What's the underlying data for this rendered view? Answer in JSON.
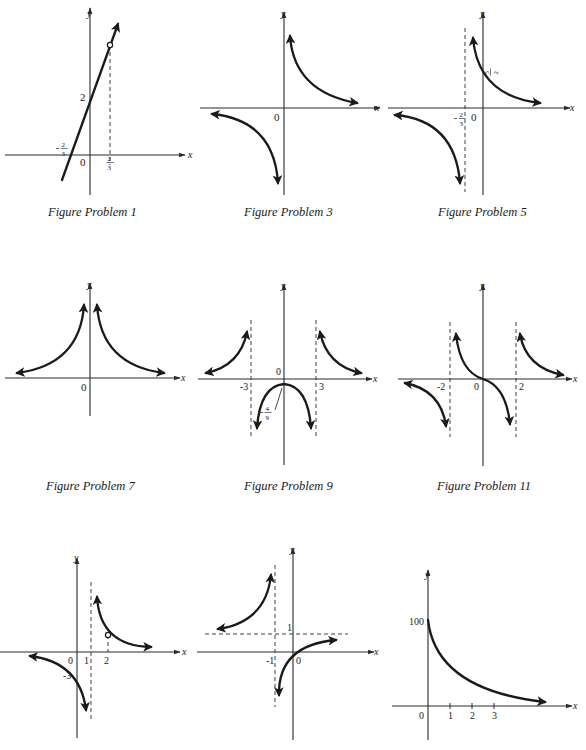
{
  "page": {
    "captions": [
      {
        "id": "fig1",
        "label": "Figure Problem 1",
        "x": 48,
        "y": 205
      },
      {
        "id": "fig3",
        "label": "Figure Problem 3",
        "x": 244,
        "y": 205
      },
      {
        "id": "fig5",
        "label": "Figure Problem 5",
        "x": 438,
        "y": 205
      },
      {
        "id": "fig7",
        "label": "Figure Problem 7",
        "x": 46,
        "y": 479
      },
      {
        "id": "fig9",
        "label": "Figure Problem 9",
        "x": 244,
        "y": 479
      },
      {
        "id": "fig11",
        "label": "Figure Problem 11",
        "x": 437,
        "y": 479
      }
    ]
  },
  "chart_data": [
    {
      "id": "fig1",
      "type": "line",
      "title": "Figure Problem 1",
      "xlabel": "x",
      "ylabel": "y",
      "description": "Line y = 3x + 2 with a hole at x = 2/3",
      "tick_labels": {
        "x": [
          "-2/3",
          "0",
          "2/3"
        ],
        "y": [
          "2"
        ]
      },
      "hole": {
        "x": "2/3",
        "y": 4
      },
      "dashed_lines": [
        {
          "orientation": "vertical",
          "at": "2/3"
        }
      ]
    },
    {
      "id": "fig3",
      "type": "line",
      "title": "Figure Problem 3",
      "xlabel": "x",
      "ylabel": "y",
      "description": "Hyperbola with branches in quadrants I and III, asymptotes x=0 and y=0",
      "tick_labels": {
        "x": [
          "0"
        ],
        "y": []
      }
    },
    {
      "id": "fig5",
      "type": "line",
      "title": "Figure Problem 5",
      "xlabel": "x",
      "ylabel": "y",
      "description": "Hyperbola with vertical asymptote x = -2/3, y-intercept 5/2",
      "tick_labels": {
        "x": [
          "-2/3",
          "0"
        ],
        "y": [
          "5/2"
        ]
      },
      "dashed_lines": [
        {
          "orientation": "vertical",
          "at": "-2/3"
        }
      ]
    },
    {
      "id": "fig7",
      "type": "line",
      "title": "Figure Problem 7",
      "xlabel": "x",
      "ylabel": "y",
      "description": "Even function with vertical asymptote x=0, both branches above x-axis",
      "tick_labels": {
        "x": [
          "0"
        ],
        "y": []
      }
    },
    {
      "id": "fig9",
      "type": "line",
      "title": "Figure Problem 9",
      "xlabel": "x",
      "ylabel": "y",
      "description": "Rational function with vertical asymptotes x = -3 and x = 3, local max at (0, -4/9)",
      "tick_labels": {
        "x": [
          "-3",
          "0",
          "3"
        ],
        "y": [
          "-4/9"
        ]
      },
      "dashed_lines": [
        {
          "orientation": "vertical",
          "at": -3
        },
        {
          "orientation": "vertical",
          "at": 3
        }
      ]
    },
    {
      "id": "fig11",
      "type": "line",
      "title": "Figure Problem 11",
      "xlabel": "x",
      "ylabel": "y",
      "description": "Odd rational function with vertical asymptotes x = -2 and x = 2, passes through origin",
      "tick_labels": {
        "x": [
          "-2",
          "0",
          "2"
        ],
        "y": []
      },
      "dashed_lines": [
        {
          "orientation": "vertical",
          "at": -2
        },
        {
          "orientation": "vertical",
          "at": 2
        }
      ]
    },
    {
      "id": "fig13",
      "type": "line",
      "title": "",
      "xlabel": "x",
      "ylabel": "y",
      "description": "Hyperbola with vertical asymptote x = 1, y-intercept -3, hole at x = 2",
      "tick_labels": {
        "x": [
          "0",
          "1",
          "2"
        ],
        "y": [
          "-3"
        ]
      },
      "hole": {
        "x": 2
      },
      "dashed_lines": [
        {
          "orientation": "vertical",
          "at": 1
        },
        {
          "orientation": "vertical",
          "at": 2
        }
      ]
    },
    {
      "id": "fig15",
      "type": "line",
      "title": "",
      "xlabel": "x",
      "ylabel": "y",
      "description": "Hyperbola with vertical asymptote x = -1, horizontal asymptote y = 1, passes through origin",
      "tick_labels": {
        "x": [
          "-1",
          "0"
        ],
        "y": [
          "1"
        ]
      },
      "dashed_lines": [
        {
          "orientation": "vertical",
          "at": -1
        },
        {
          "orientation": "horizontal",
          "at": 1
        }
      ]
    },
    {
      "id": "fig17",
      "type": "line",
      "title": "",
      "xlabel": "x",
      "ylabel": "y",
      "description": "Decaying curve starting at y = 100 when x = 0, approaching 0",
      "tick_labels": {
        "x": [
          "0",
          "1",
          "2",
          "3"
        ],
        "y": [
          "100"
        ]
      },
      "ylim": [
        0,
        100
      ]
    }
  ],
  "figures": [
    {
      "id": "fig1",
      "axes": {
        "ox": 90,
        "oy": 155,
        "xmin": 5,
        "xmax": 185,
        "ymin": 8,
        "ymax": 195
      },
      "axis_labels": [
        {
          "t": "y",
          "x": 87,
          "y": 17
        },
        {
          "t": "x",
          "x": 188,
          "y": 158
        }
      ],
      "dashed": [
        [
          110,
          45,
          110,
          165
        ]
      ],
      "curves": [
        {
          "d": "M62,180 L118,24",
          "arrow_end": true
        }
      ],
      "holes": [
        [
          110,
          45
        ]
      ],
      "labels": [
        {
          "t": "2",
          "x": 80,
          "y": 101,
          "size": 11
        },
        {
          "t": "0",
          "x": 80,
          "y": 166,
          "size": 11
        }
      ],
      "fractions": [
        {
          "neg": true,
          "n": "2",
          "d": "3",
          "x": 64,
          "y": 148
        },
        {
          "neg": false,
          "n": "2",
          "d": "3",
          "x": 110,
          "y": 162
        }
      ]
    },
    {
      "id": "fig3",
      "axes": {
        "ox": 284,
        "oy": 108,
        "xmin": 200,
        "xmax": 380,
        "ymin": 12,
        "ymax": 195
      },
      "axis_labels": [
        {
          "t": "y",
          "x": 281,
          "y": 17
        },
        {
          "t": "x",
          "x": 375,
          "y": 111
        }
      ],
      "dashed": [],
      "curves": [
        {
          "d": "M290,36 Q294,92 357,103",
          "arrow_start": true,
          "arrow_end": true
        },
        {
          "d": "M212,114 Q274,120 278,183",
          "arrow_start": true,
          "arrow_end": true
        }
      ],
      "holes": [],
      "labels": [
        {
          "t": "0",
          "x": 274,
          "y": 121,
          "size": 11
        }
      ],
      "fractions": []
    },
    {
      "id": "fig5",
      "axes": {
        "ox": 483,
        "oy": 108,
        "xmin": 388,
        "xmax": 570,
        "ymin": 12,
        "ymax": 195
      },
      "axis_labels": [
        {
          "t": "y",
          "x": 480,
          "y": 17
        },
        {
          "t": "x",
          "x": 570,
          "y": 111
        }
      ],
      "dashed": [
        [
          465,
          28,
          465,
          192
        ]
      ],
      "curves": [
        {
          "d": "M473,38 Q478,96 540,103",
          "arrow_start": true,
          "arrow_end": true
        },
        {
          "d": "M395,115 Q455,120 460,183",
          "arrow_start": true,
          "arrow_end": true
        }
      ],
      "holes": [],
      "labels": [
        {
          "t": "0",
          "x": 471,
          "y": 121,
          "size": 11
        }
      ],
      "fractions": [
        {
          "neg": false,
          "n": "5",
          "d": "2",
          "x": 490,
          "y": 72,
          "rotate": true
        },
        {
          "neg": true,
          "n": "2",
          "d": "3",
          "x": 462,
          "y": 118
        }
      ]
    },
    {
      "id": "fig7",
      "axes": {
        "ox": 90,
        "oy": 378,
        "xmin": 5,
        "xmax": 180,
        "ymin": 283,
        "ymax": 416
      },
      "axis_labels": [
        {
          "t": "y",
          "x": 87,
          "y": 288
        },
        {
          "t": "x",
          "x": 181,
          "y": 381
        }
      ],
      "dashed": [],
      "curves": [
        {
          "d": "M17,373 Q80,365 84,305",
          "arrow_start": true,
          "arrow_end": true
        },
        {
          "d": "M97,305 Q101,365 164,373",
          "arrow_start": true,
          "arrow_end": true
        }
      ],
      "holes": [],
      "labels": [
        {
          "t": "0",
          "x": 81,
          "y": 391,
          "size": 11
        }
      ],
      "fractions": []
    },
    {
      "id": "fig9",
      "axes": {
        "ox": 284,
        "oy": 379,
        "xmin": 198,
        "xmax": 372,
        "ymin": 284,
        "ymax": 465
      },
      "axis_labels": [
        {
          "t": "y",
          "x": 281,
          "y": 289
        },
        {
          "t": "x",
          "x": 373,
          "y": 382
        }
      ],
      "dashed": [
        [
          251,
          320,
          251,
          437
        ],
        [
          316,
          320,
          316,
          437
        ]
      ],
      "curves": [
        {
          "d": "M206,373 Q240,366 247,332",
          "arrow_start": true,
          "arrow_end": true
        },
        {
          "d": "M320,332 Q327,366 361,373",
          "arrow_start": true,
          "arrow_end": true
        },
        {
          "d": "M257,428 Q260,386 284,384 Q308,386 311,428",
          "arrow_start": true,
          "arrow_end": true
        }
      ],
      "holes": [],
      "leader": [
        275,
        410,
        282,
        388
      ],
      "labels": [
        {
          "t": "0",
          "x": 276,
          "y": 375,
          "size": 10
        },
        {
          "t": "-3",
          "x": 240,
          "y": 390,
          "size": 10
        },
        {
          "t": "3",
          "x": 319,
          "y": 390,
          "size": 10
        }
      ],
      "fractions": [
        {
          "neg": true,
          "n": "4",
          "d": "9",
          "x": 268,
          "y": 412
        }
      ]
    },
    {
      "id": "fig11",
      "axes": {
        "ox": 483,
        "oy": 379,
        "xmin": 398,
        "xmax": 572,
        "ymin": 284,
        "ymax": 466
      },
      "axis_labels": [
        {
          "t": "y",
          "x": 480,
          "y": 289
        },
        {
          "t": "x",
          "x": 573,
          "y": 382
        }
      ],
      "dashed": [
        [
          450,
          322,
          450,
          437
        ],
        [
          516,
          322,
          516,
          437
        ]
      ],
      "curves": [
        {
          "d": "M456,334 Q460,372 483,379 Q506,386 510,424",
          "arrow_start": true,
          "arrow_end": true
        },
        {
          "d": "M520,334 Q526,368 563,375",
          "arrow_start": true,
          "arrow_end": true
        },
        {
          "d": "M405,383 Q441,390 446,426",
          "arrow_start": true,
          "arrow_end": true
        }
      ],
      "holes": [],
      "labels": [
        {
          "t": "-2",
          "x": 437,
          "y": 390,
          "size": 10
        },
        {
          "t": "0",
          "x": 474,
          "y": 390,
          "size": 10
        },
        {
          "t": "2",
          "x": 519,
          "y": 390,
          "size": 10
        }
      ],
      "fractions": []
    },
    {
      "id": "fig13",
      "axes": {
        "ox": 77,
        "oy": 652,
        "xmin": 0,
        "xmax": 180,
        "ymin": 558,
        "ymax": 738
      },
      "axis_labels": [
        {
          "t": "y",
          "x": 74,
          "y": 561
        },
        {
          "t": "x",
          "x": 182,
          "y": 655
        }
      ],
      "dashed": [
        [
          91,
          582,
          91,
          722
        ],
        [
          108,
          635,
          108,
          652
        ]
      ],
      "curves": [
        {
          "d": "M97,597 Q100,646 151,647",
          "arrow_start": true,
          "arrow_end": true
        },
        {
          "d": "M30,656 Q80,662 86,710",
          "arrow_start": true,
          "arrow_end": true
        }
      ],
      "holes": [
        [
          108,
          635
        ]
      ],
      "labels": [
        {
          "t": "0",
          "x": 68,
          "y": 664,
          "size": 10
        },
        {
          "t": "1",
          "x": 84,
          "y": 664,
          "size": 10
        },
        {
          "t": "2",
          "x": 104,
          "y": 664,
          "size": 10
        },
        {
          "t": "-3",
          "x": 63,
          "y": 679,
          "size": 10
        }
      ],
      "fractions": []
    },
    {
      "id": "fig15",
      "axes": {
        "ox": 293,
        "oy": 652,
        "xmin": 197,
        "xmax": 374,
        "ymin": 548,
        "ymax": 740
      },
      "axis_labels": [
        {
          "t": "y",
          "x": 290,
          "y": 553
        },
        {
          "t": "x",
          "x": 374,
          "y": 655
        }
      ],
      "dashed": [
        [
          275,
          565,
          275,
          707
        ],
        [
          205,
          634,
          348,
          634
        ]
      ],
      "curves": [
        {
          "d": "M218,629 Q266,622 271,575",
          "arrow_start": true,
          "arrow_end": true
        },
        {
          "d": "M279,695 Q278,645 336,640",
          "arrow_start": true,
          "arrow_end": true
        }
      ],
      "holes": [],
      "labels": [
        {
          "t": "1",
          "x": 287,
          "y": 631,
          "size": 10
        },
        {
          "t": "-1",
          "x": 266,
          "y": 664,
          "size": 10
        },
        {
          "t": "0",
          "x": 296,
          "y": 664,
          "size": 10
        }
      ],
      "fractions": []
    },
    {
      "id": "fig17",
      "axes": {
        "ox": 428,
        "oy": 706,
        "xmin": 392,
        "xmax": 572,
        "ymin": 570,
        "ymax": 740
      },
      "axis_labels": [
        {
          "t": "y",
          "x": 425,
          "y": 578
        },
        {
          "t": "x",
          "x": 573,
          "y": 709
        }
      ],
      "dashed": [],
      "curves": [
        {
          "d": "M428,620 Q436,690 545,702",
          "arrow_end": true
        }
      ],
      "holes": [],
      "ticks": [
        450,
        472,
        494
      ],
      "labels": [
        {
          "t": "100",
          "x": 409,
          "y": 625,
          "size": 10
        },
        {
          "t": "0",
          "x": 419,
          "y": 719,
          "size": 10
        },
        {
          "t": "1",
          "x": 448,
          "y": 719,
          "size": 10
        },
        {
          "t": "2",
          "x": 470,
          "y": 719,
          "size": 10
        },
        {
          "t": "3",
          "x": 492,
          "y": 719,
          "size": 10
        }
      ],
      "fractions": []
    }
  ],
  "style": {
    "ink": "#1a1a1a",
    "axis_ink": "#2a2a2a",
    "background": "#ffffff"
  }
}
